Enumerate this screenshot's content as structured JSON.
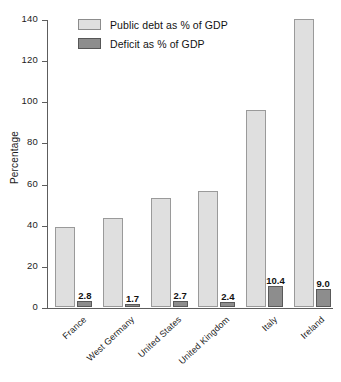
{
  "chart_data": {
    "type": "bar",
    "title": "",
    "xlabel": "",
    "ylabel": "Percentage",
    "ylim": [
      0,
      140
    ],
    "yticks": [
      0,
      20,
      40,
      60,
      80,
      100,
      120,
      140
    ],
    "ytick_labels": [
      "0",
      "20",
      "40",
      "60",
      "80",
      "100",
      "120",
      "140"
    ],
    "grid": false,
    "legend_position": "top-left-inside",
    "categories": [
      "France",
      "West Germany",
      "United States",
      "United Kingdom",
      "Italy",
      "Ireland"
    ],
    "series": [
      {
        "name": "Public debt as % of GDP",
        "color": "#dfdfdf",
        "border_color": "#9a9a9a",
        "values": [
          39,
          43.5,
          53,
          56.5,
          96,
          140
        ],
        "labels_shown": false
      },
      {
        "name": "Deficit as % of GDP",
        "color": "#8d8d8d",
        "border_color": "#595959",
        "values": [
          2.8,
          1.7,
          2.7,
          2.4,
          10.4,
          9.0
        ],
        "labels_shown": true,
        "value_labels": [
          "2.8",
          "1.7",
          "2.7",
          "2.4",
          "10.4",
          "9.0"
        ]
      }
    ]
  },
  "legend": {
    "items": [
      {
        "label": "Public debt as % of GDP",
        "swatch": "debt"
      },
      {
        "label": "Deficit as % of GDP",
        "swatch": "deficit"
      }
    ]
  },
  "axes": {
    "y_title": "Percentage"
  }
}
